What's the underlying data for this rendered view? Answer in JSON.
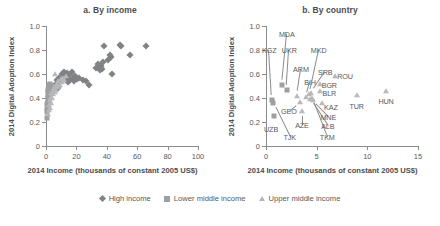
{
  "figure": {
    "width": 440,
    "height": 226,
    "background": "#ffffff"
  },
  "legend": {
    "position": "bottom-center",
    "items": [
      {
        "label": "High income",
        "marker": "diamond",
        "color": "#808285"
      },
      {
        "label": "Lower middle income",
        "marker": "square",
        "color": "#9d9fa2"
      },
      {
        "label": "Upper middle income",
        "marker": "triangle",
        "color": "#b6b8ba"
      }
    ]
  },
  "chart_data": [
    {
      "type": "scatter",
      "panel": "a",
      "title": "a. By income",
      "xlabel": "2014 Income (thousands of constant 2005 US$)",
      "ylabel": "2014 Digital Adoption Index",
      "xlim": [
        0,
        100
      ],
      "ylim": [
        0,
        1.0
      ],
      "xticks": [
        0,
        20,
        40,
        60,
        80,
        100
      ],
      "xticklabels": [
        "0",
        "20",
        "40",
        "60",
        "80",
        "100"
      ],
      "yticks": [
        0,
        0.2,
        0.4,
        0.6,
        0.8,
        1.0
      ],
      "yticklabels": [
        "0",
        "0.2",
        "0.4",
        "0.6",
        "0.8",
        "1.0"
      ],
      "grid": false,
      "series": [
        {
          "name": "High income",
          "marker": "diamond",
          "color": "#808285",
          "points": [
            [
              5.2,
              0.5
            ],
            [
              6.4,
              0.52
            ],
            [
              7.1,
              0.55
            ],
            [
              7.8,
              0.48
            ],
            [
              8.6,
              0.57
            ],
            [
              9.4,
              0.53
            ],
            [
              10.2,
              0.6
            ],
            [
              10.9,
              0.56
            ],
            [
              11.6,
              0.62
            ],
            [
              12.3,
              0.58
            ],
            [
              12.9,
              0.55
            ],
            [
              13.5,
              0.61
            ],
            [
              14.2,
              0.57
            ],
            [
              14.8,
              0.53
            ],
            [
              15.4,
              0.59
            ],
            [
              16.1,
              0.55
            ],
            [
              16.8,
              0.62
            ],
            [
              17.5,
              0.57
            ],
            [
              18.3,
              0.54
            ],
            [
              19.0,
              0.58
            ],
            [
              20.2,
              0.56
            ],
            [
              22.0,
              0.57
            ],
            [
              24.1,
              0.55
            ],
            [
              26.3,
              0.54
            ],
            [
              28.5,
              0.51
            ],
            [
              33.0,
              0.65
            ],
            [
              34.2,
              0.68
            ],
            [
              34.8,
              0.66
            ],
            [
              35.4,
              0.63
            ],
            [
              36.1,
              0.67
            ],
            [
              36.8,
              0.64
            ],
            [
              37.4,
              0.7
            ],
            [
              38.0,
              0.83
            ],
            [
              41.0,
              0.72
            ],
            [
              41.8,
              0.76
            ],
            [
              42.5,
              0.74
            ],
            [
              43.2,
              0.6
            ],
            [
              48.8,
              0.84
            ],
            [
              49.5,
              0.83
            ],
            [
              55.0,
              0.76
            ],
            [
              65.8,
              0.83
            ]
          ]
        },
        {
          "name": "Lower middle income",
          "marker": "square",
          "color": "#9d9fa2",
          "points": [
            [
              0.6,
              0.23
            ],
            [
              0.7,
              0.31
            ],
            [
              0.8,
              0.35
            ],
            [
              0.9,
              0.28
            ],
            [
              1.0,
              0.38
            ],
            [
              1.1,
              0.33
            ],
            [
              1.2,
              0.42
            ],
            [
              1.3,
              0.36
            ],
            [
              1.4,
              0.45
            ],
            [
              1.5,
              0.4
            ],
            [
              1.6,
              0.47
            ],
            [
              1.7,
              0.43
            ],
            [
              1.9,
              0.49
            ],
            [
              2.0,
              0.44
            ],
            [
              2.2,
              0.51
            ],
            [
              2.4,
              0.46
            ],
            [
              2.6,
              0.52
            ],
            [
              2.8,
              0.48
            ],
            [
              3.1,
              0.5
            ],
            [
              3.4,
              0.45
            ],
            [
              3.8,
              0.49
            ],
            [
              4.2,
              0.47
            ]
          ]
        },
        {
          "name": "Upper middle income",
          "marker": "triangle",
          "color": "#b6b8ba",
          "points": [
            [
              1.3,
              0.27
            ],
            [
              1.8,
              0.3
            ],
            [
              2.1,
              0.34
            ],
            [
              2.4,
              0.38
            ],
            [
              2.7,
              0.32
            ],
            [
              3.0,
              0.41
            ],
            [
              3.3,
              0.36
            ],
            [
              3.6,
              0.44
            ],
            [
              3.9,
              0.4
            ],
            [
              4.3,
              0.46
            ],
            [
              4.7,
              0.43
            ],
            [
              5.1,
              0.48
            ],
            [
              5.6,
              0.45
            ],
            [
              6.0,
              0.5
            ],
            [
              6.5,
              0.47
            ],
            [
              7.0,
              0.52
            ],
            [
              7.6,
              0.49
            ],
            [
              8.2,
              0.54
            ],
            [
              8.9,
              0.51
            ],
            [
              9.6,
              0.56
            ],
            [
              6.2,
              0.6
            ],
            [
              10.4,
              0.53
            ],
            [
              11.2,
              0.57
            ],
            [
              12.0,
              0.55
            ],
            [
              13.0,
              0.58
            ]
          ]
        }
      ]
    },
    {
      "type": "scatter",
      "panel": "b",
      "title": "b. By country",
      "xlabel": "2014 Income (thousands of constant 2005 US$)",
      "ylabel": "2014 Digital Adoption Index",
      "xlim": [
        0,
        15
      ],
      "ylim": [
        0,
        1.0
      ],
      "xticks": [
        0,
        5,
        10,
        15
      ],
      "xticklabels": [
        "0",
        "5",
        "10",
        "15"
      ],
      "yticks": [
        0,
        0.2,
        0.4,
        0.6,
        0.8,
        1.0
      ],
      "yticklabels": [
        "0",
        "0.2",
        "0.4",
        "0.6",
        "0.8",
        "1.0"
      ],
      "grid": false,
      "points": [
        {
          "code": "KGZ",
          "x": 0.62,
          "y": 0.38,
          "marker": "square",
          "label_x": 0.32,
          "label_y": 0.8,
          "leader": true
        },
        {
          "code": "UZB",
          "x": 0.78,
          "y": 0.25,
          "marker": "square",
          "label_x": 0.5,
          "label_y": 0.145,
          "leader": false
        },
        {
          "code": "MDA",
          "x": 1.55,
          "y": 0.51,
          "marker": "square",
          "label_x": 2.05,
          "label_y": 0.93,
          "leader": true
        },
        {
          "code": "UKR",
          "x": 2.05,
          "y": 0.47,
          "marker": "square",
          "label_x": 2.3,
          "label_y": 0.8,
          "leader": true
        },
        {
          "code": "TJK",
          "x": 0.7,
          "y": 0.36,
          "marker": "square",
          "label_x": 2.35,
          "label_y": 0.075,
          "leader": true
        },
        {
          "code": "GEO",
          "x": 3.35,
          "y": 0.37,
          "marker": "triangle",
          "label_x": 2.25,
          "label_y": 0.295,
          "leader": true
        },
        {
          "code": "ARM",
          "x": 3.05,
          "y": 0.42,
          "marker": "triangle",
          "label_x": 3.45,
          "label_y": 0.645,
          "leader": true
        },
        {
          "code": "AZE",
          "x": 3.55,
          "y": 0.295,
          "marker": "triangle",
          "label_x": 3.55,
          "label_y": 0.175,
          "leader": true
        },
        {
          "code": "BIH",
          "x": 3.95,
          "y": 0.41,
          "marker": "triangle",
          "label_x": 4.35,
          "label_y": 0.535,
          "leader": true
        },
        {
          "code": "MKD",
          "x": 4.25,
          "y": 0.43,
          "marker": "triangle",
          "label_x": 5.2,
          "label_y": 0.8,
          "leader": true
        },
        {
          "code": "SRB",
          "x": 4.45,
          "y": 0.44,
          "marker": "triangle",
          "label_x": 5.85,
          "label_y": 0.615,
          "leader": true
        },
        {
          "code": "TKM",
          "x": 4.55,
          "y": 0.4,
          "marker": "triangle",
          "label_x": 6.05,
          "label_y": 0.075,
          "leader": true
        },
        {
          "code": "ALB",
          "x": 4.35,
          "y": 0.39,
          "marker": "triangle",
          "label_x": 6.1,
          "label_y": 0.165,
          "leader": true
        },
        {
          "code": "MNE",
          "x": 4.6,
          "y": 0.38,
          "marker": "triangle",
          "label_x": 6.15,
          "label_y": 0.245,
          "leader": true
        },
        {
          "code": "KAZ",
          "x": 5.55,
          "y": 0.355,
          "marker": "triangle",
          "label_x": 6.4,
          "label_y": 0.325,
          "leader": false
        },
        {
          "code": "BGR",
          "x": 5.3,
          "y": 0.515,
          "marker": "triangle",
          "label_x": 6.25,
          "label_y": 0.505,
          "leader": false
        },
        {
          "code": "BLR",
          "x": 5.3,
          "y": 0.455,
          "marker": "triangle",
          "label_x": 6.25,
          "label_y": 0.445,
          "leader": false
        },
        {
          "code": "ROU",
          "x": 6.85,
          "y": 0.585,
          "marker": "triangle",
          "label_x": 7.8,
          "label_y": 0.585,
          "leader": false
        },
        {
          "code": "TUR",
          "x": 8.95,
          "y": 0.425,
          "marker": "triangle",
          "label_x": 8.95,
          "label_y": 0.335,
          "leader": false
        },
        {
          "code": "HUN",
          "x": 11.85,
          "y": 0.455,
          "marker": "triangle",
          "label_x": 11.85,
          "label_y": 0.375,
          "leader": false
        }
      ]
    }
  ]
}
